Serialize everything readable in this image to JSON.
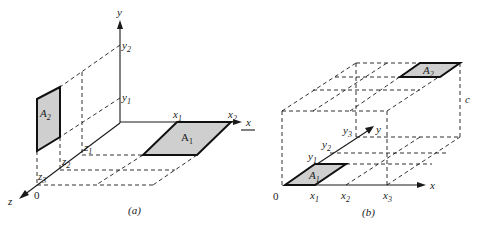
{
  "figure": {
    "panel_a": {
      "caption": "(a)",
      "axes": {
        "x": "x",
        "y": "y",
        "z": "z",
        "origin": "0"
      },
      "ticks": {
        "x1": {
          "base": "x",
          "sub": "1"
        },
        "x2": {
          "base": "x",
          "sub": "2"
        },
        "y1": {
          "base": "y",
          "sub": "1"
        },
        "y2": {
          "base": "y",
          "sub": "2"
        },
        "z1": {
          "base": "z",
          "sub": "1"
        },
        "z2": {
          "base": "z",
          "sub": "2"
        },
        "z3": {
          "base": "z",
          "sub": "3"
        }
      },
      "areas": {
        "A1": {
          "base": "A",
          "sub": "1",
          "plane": "xz",
          "fill": "#cfcfcf"
        },
        "A2": {
          "base": "A",
          "sub": "2",
          "plane": "yz",
          "fill": "#cfcfcf"
        }
      }
    },
    "panel_b": {
      "caption": "(b)",
      "axes": {
        "x": "x",
        "y": "y",
        "origin": "0",
        "height": "c"
      },
      "ticks": {
        "x1": {
          "base": "x",
          "sub": "1"
        },
        "x2": {
          "base": "x",
          "sub": "2"
        },
        "x3": {
          "base": "x",
          "sub": "3"
        },
        "y1": {
          "base": "y",
          "sub": "1"
        },
        "y2": {
          "base": "y",
          "sub": "2"
        },
        "y3": {
          "base": "y",
          "sub": "3"
        }
      },
      "areas": {
        "A1": {
          "base": "A",
          "sub": "1",
          "plane": "bottom",
          "fill": "#cfcfcf"
        },
        "A2": {
          "base": "A",
          "sub": "2",
          "plane": "top",
          "fill": "#cfcfcf"
        }
      }
    },
    "left_edge_arrow_label": "x"
  }
}
